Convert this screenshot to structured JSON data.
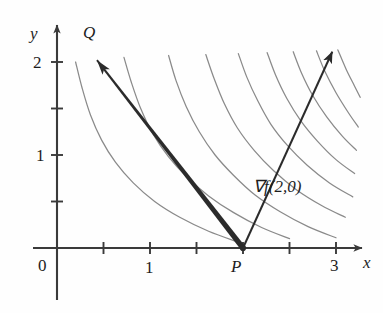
{
  "figure": {
    "kind": "math-diagram",
    "background_color": "#fefefe",
    "axis_color": "#3a3a3a",
    "curve_color": "#8a8a8a",
    "vector_color": "#2b2b2b",
    "text_color": "#1d1d1d"
  },
  "axes": {
    "x_axis_label": "x",
    "y_axis_label": "y",
    "origin_label": "0",
    "x_ticks": [
      {
        "value": 0.5,
        "label": ""
      },
      {
        "value": 1.0,
        "label": "1"
      },
      {
        "value": 1.5,
        "label": ""
      },
      {
        "value": 2.0,
        "label": ""
      },
      {
        "value": 2.5,
        "label": ""
      },
      {
        "value": 3.0,
        "label": "3"
      }
    ],
    "y_ticks": [
      {
        "value": 0.5,
        "label": ""
      },
      {
        "value": 1.0,
        "label": "1"
      },
      {
        "value": 1.5,
        "label": ""
      },
      {
        "value": 2.0,
        "label": "2"
      }
    ],
    "x_range": [
      -0.15,
      3.3
    ],
    "y_range": [
      -0.4,
      2.4
    ]
  },
  "points": [
    {
      "name": "P",
      "label": "P",
      "x": 2.0,
      "y": 0.0,
      "marker": "dot"
    },
    {
      "name": "Q",
      "label": "Q",
      "x": 0.43,
      "y": 2.12,
      "marker": "none"
    }
  ],
  "vectors": [
    {
      "name": "vector-pq",
      "label": "",
      "from": {
        "x": 2.0,
        "y": 0.0
      },
      "to": {
        "x": 0.43,
        "y": 2.02
      },
      "style": "arrow",
      "tapered": true
    },
    {
      "name": "gradient-vector",
      "label": "∇f(2, 0)",
      "label_parts": {
        "operator": "∇",
        "function": "f",
        "args": "(2, 0)"
      },
      "from": {
        "x": 2.0,
        "y": 0.0
      },
      "to": {
        "x": 2.96,
        "y": 2.11
      },
      "style": "arrow",
      "tapered": false
    }
  ],
  "labels": {
    "gradient": "∇f(2,0)",
    "point_p": "P",
    "point_q": "Q",
    "axis_x": "x",
    "axis_y": "y",
    "zero": "0",
    "x_one": "1",
    "x_three": "3",
    "y_one": "1",
    "y_two": "2"
  },
  "chart_data": {
    "type": "line",
    "title": "",
    "xlabel": "x",
    "ylabel": "y",
    "xlim": [
      -0.15,
      3.3
    ],
    "ylim": [
      -0.4,
      2.4
    ],
    "grid": false,
    "legend": "none",
    "annotations": [
      {
        "text": "P",
        "x": 2.0,
        "y": -0.2
      },
      {
        "text": "Q",
        "x": 0.43,
        "y": 2.28
      },
      {
        "text": "∇f(2,0)",
        "x": 2.45,
        "y": 0.66
      }
    ],
    "series": [
      {
        "name": "level-curve-1",
        "comment": "leftmost level curve",
        "points": [
          [
            0.2,
            2.0
          ],
          [
            0.27,
            1.72
          ],
          [
            0.36,
            1.43
          ],
          [
            0.48,
            1.16
          ],
          [
            0.63,
            0.92
          ],
          [
            0.82,
            0.7
          ],
          [
            1.05,
            0.5
          ],
          [
            1.32,
            0.33
          ],
          [
            1.63,
            0.18
          ],
          [
            1.93,
            0.07
          ]
        ]
      },
      {
        "name": "level-curve-2",
        "points": [
          [
            0.72,
            2.05
          ],
          [
            0.8,
            1.78
          ],
          [
            0.9,
            1.5
          ],
          [
            1.03,
            1.23
          ],
          [
            1.2,
            0.98
          ],
          [
            1.4,
            0.76
          ],
          [
            1.63,
            0.56
          ],
          [
            1.9,
            0.38
          ],
          [
            2.2,
            0.22
          ],
          [
            2.5,
            0.1
          ]
        ]
      },
      {
        "name": "level-curve-3",
        "comment": "curve through P",
        "points": [
          [
            1.2,
            2.07
          ],
          [
            1.28,
            1.8
          ],
          [
            1.39,
            1.52
          ],
          [
            1.53,
            1.25
          ],
          [
            1.7,
            1.0
          ],
          [
            1.9,
            0.78
          ],
          [
            2.13,
            0.57
          ],
          [
            2.4,
            0.39
          ],
          [
            2.7,
            0.23
          ],
          [
            3.0,
            0.11
          ]
        ]
      },
      {
        "name": "level-curve-4",
        "points": [
          [
            1.6,
            2.08
          ],
          [
            1.69,
            1.82
          ],
          [
            1.8,
            1.55
          ],
          [
            1.94,
            1.29
          ],
          [
            2.12,
            1.05
          ],
          [
            2.33,
            0.83
          ],
          [
            2.57,
            0.63
          ],
          [
            2.84,
            0.46
          ],
          [
            3.1,
            0.33
          ]
        ]
      },
      {
        "name": "level-curve-5",
        "points": [
          [
            1.95,
            2.09
          ],
          [
            2.04,
            1.84
          ],
          [
            2.16,
            1.58
          ],
          [
            2.3,
            1.33
          ],
          [
            2.48,
            1.1
          ],
          [
            2.69,
            0.89
          ],
          [
            2.93,
            0.7
          ],
          [
            3.18,
            0.55
          ]
        ]
      },
      {
        "name": "level-curve-6",
        "points": [
          [
            2.26,
            2.1
          ],
          [
            2.35,
            1.86
          ],
          [
            2.47,
            1.61
          ],
          [
            2.62,
            1.37
          ],
          [
            2.8,
            1.15
          ],
          [
            3.0,
            0.95
          ],
          [
            3.2,
            0.8
          ]
        ]
      },
      {
        "name": "level-curve-7",
        "points": [
          [
            2.54,
            2.11
          ],
          [
            2.63,
            1.88
          ],
          [
            2.75,
            1.64
          ],
          [
            2.9,
            1.41
          ],
          [
            3.07,
            1.2
          ],
          [
            3.22,
            1.05
          ]
        ]
      },
      {
        "name": "level-curve-8",
        "points": [
          [
            2.79,
            2.12
          ],
          [
            2.88,
            1.9
          ],
          [
            3.0,
            1.67
          ],
          [
            3.13,
            1.46
          ],
          [
            3.24,
            1.3
          ]
        ]
      },
      {
        "name": "level-curve-9",
        "points": [
          [
            3.02,
            2.13
          ],
          [
            3.11,
            1.92
          ],
          [
            3.2,
            1.74
          ],
          [
            3.26,
            1.62
          ]
        ]
      }
    ]
  }
}
